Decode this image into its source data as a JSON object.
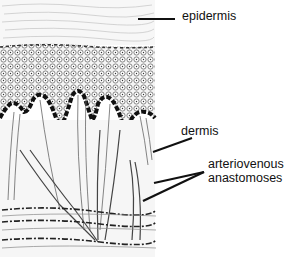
{
  "figure": {
    "type": "anatomical cross-section of skin",
    "labels": {
      "epidermis": "epidermis",
      "dermis": "dermis",
      "anastomoses_line1": "arteriovenous",
      "anastomoses_line2": "anastomoses"
    }
  }
}
